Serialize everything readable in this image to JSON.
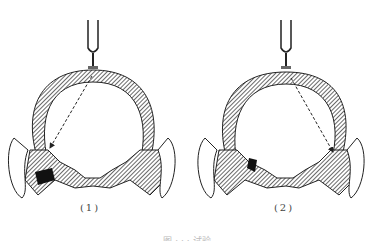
{
  "figure": {
    "panels": [
      {
        "label": "(1)",
        "arrow_target": "left-ear"
      },
      {
        "label": "(2)",
        "arrow_target": "right-ear"
      }
    ],
    "caption": "图 · · · 试验",
    "colors": {
      "stroke": "#222222",
      "hatch": "#555555",
      "background": "#ffffff"
    }
  }
}
